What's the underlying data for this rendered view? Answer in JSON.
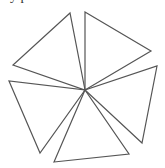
{
  "caption": "y p",
  "diagram": {
    "stroke": "#555555",
    "center": [
      85,
      90
    ],
    "triangles": [
      {
        "name": "top-left",
        "points": "70,13 13,65 85,90"
      },
      {
        "name": "top-right",
        "points": "85,12 151,51 85,90"
      },
      {
        "name": "right",
        "points": "157,66 142,143 85,90"
      },
      {
        "name": "bottom",
        "points": "54,162 129,154 85,90"
      },
      {
        "name": "left",
        "points": "9,81 40,153 85,90"
      }
    ]
  }
}
